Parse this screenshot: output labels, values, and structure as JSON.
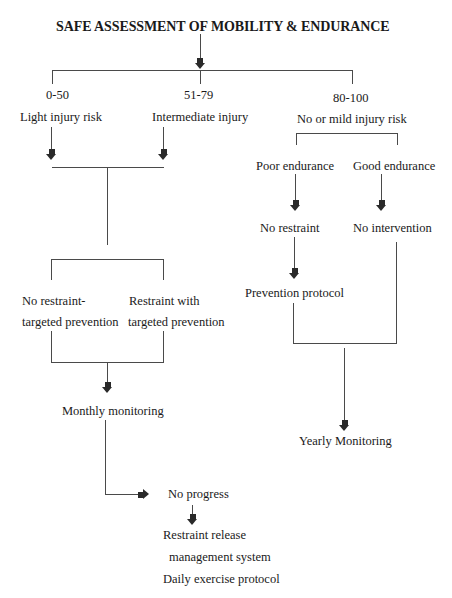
{
  "diagram": {
    "title": "SAFE ASSESSMENT OF MOBILITY & ENDURANCE",
    "score_ranges": [
      {
        "range": "0-50",
        "label": "Light injury risk"
      },
      {
        "range": "51-79",
        "label": "Intermediate injury"
      },
      {
        "range": "80-100",
        "label": "No or mild injury risk"
      }
    ],
    "left_branch": {
      "option_a": {
        "line1": "No restraint-",
        "line2": "targeted prevention"
      },
      "option_b": {
        "line1": "Restraint with",
        "line2": "targeted prevention"
      },
      "monitoring": "Monthly monitoring",
      "no_progress": "No progress",
      "followup": {
        "line1": "Restraint release",
        "line2": "management system",
        "line3": "Daily exercise protocol"
      }
    },
    "right_branch": {
      "poor": "Poor endurance",
      "good": "Good endurance",
      "poor_action": "No restraint",
      "good_action": "No intervention",
      "poor_protocol": "Prevention protocol",
      "monitoring": "Yearly Monitoring"
    },
    "colors": {
      "line": "#4a4a4a",
      "arrow": "#2a2a2a",
      "text": "#1a1a1a",
      "background": "#ffffff"
    }
  }
}
